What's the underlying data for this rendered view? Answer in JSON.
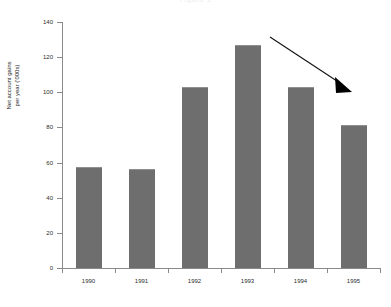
{
  "chart_data": {
    "type": "bar",
    "title": "Figure 1",
    "subtitle": "",
    "xlabel": "",
    "ylabel": "Net account gains\nper year ('000s)",
    "categories": [
      "1990",
      "1991",
      "1992",
      "1993",
      "1994",
      "1995"
    ],
    "values": [
      57.5,
      56.5,
      103,
      127,
      103,
      81.5
    ],
    "series": [
      {
        "name": "Net account gains per year ('000s)",
        "values": [
          57.5,
          56.5,
          103,
          127,
          103,
          81.5
        ]
      }
    ],
    "ylim": [
      0,
      140
    ],
    "y_ticks": [
      0,
      20,
      40,
      60,
      80,
      100,
      120,
      140
    ],
    "y_tick_labels": [
      "0",
      "20",
      "40",
      "60",
      "80",
      "100",
      "120",
      "140"
    ],
    "grid": false,
    "legend": null,
    "bar_color": "#6e6e6e",
    "axis_color": "#8a8a8a",
    "background_color": "#ffffff",
    "annotations": [
      {
        "name": "downward-trend-arrow",
        "type": "arrow",
        "label": "",
        "color": "#000000",
        "from": [
          270,
          37
        ],
        "to": [
          350,
          90
        ]
      }
    ]
  }
}
